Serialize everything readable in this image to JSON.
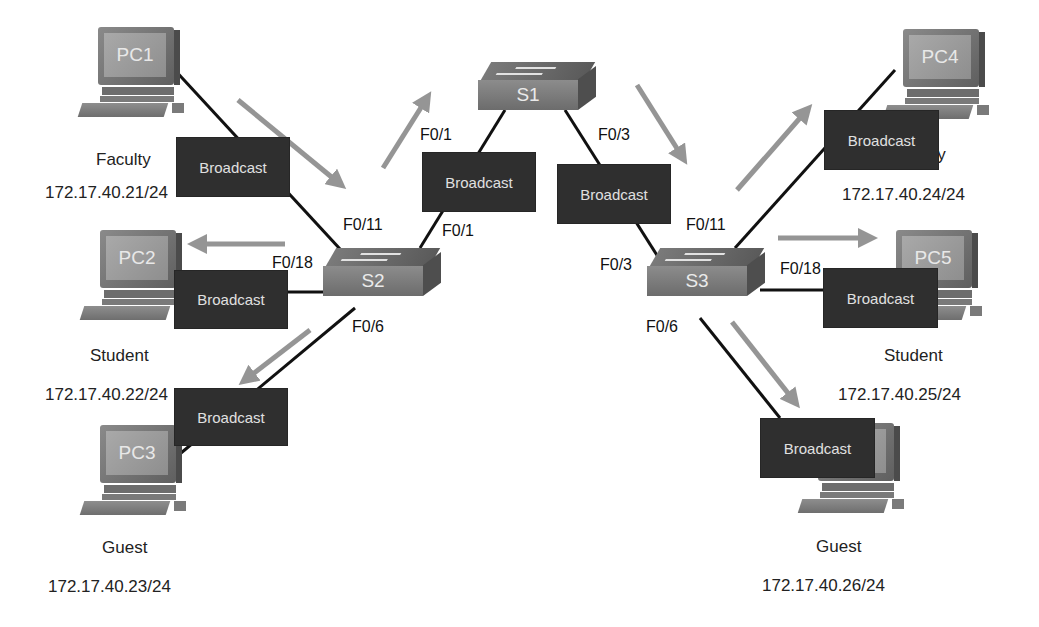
{
  "diagram": {
    "title_clipped": "",
    "switches": [
      {
        "id": "S1",
        "label": "S1"
      },
      {
        "id": "S2",
        "label": "S2"
      },
      {
        "id": "S3",
        "label": "S3"
      }
    ],
    "pcs": [
      {
        "id": "PC1",
        "label": "PC1",
        "role": "Faculty",
        "ip": "172.17.40.21/24"
      },
      {
        "id": "PC2",
        "label": "PC2",
        "role": "Student",
        "ip": "172.17.40.22/24"
      },
      {
        "id": "PC3",
        "label": "PC3",
        "role": "Guest",
        "ip": "172.17.40.23/24"
      },
      {
        "id": "PC4",
        "label": "PC4",
        "role": "Faculty",
        "ip": "172.17.40.24/24"
      },
      {
        "id": "PC5",
        "label": "PC5",
        "role": "Student",
        "ip": "172.17.40.25/24"
      },
      {
        "id": "PC6",
        "label": "",
        "role": "Guest",
        "ip": "172.17.40.26/24"
      }
    ],
    "ports": {
      "s2_f011": "F0/11",
      "s2_f018": "F0/18",
      "s2_f06": "F0/6",
      "s2_f01": "F0/1",
      "s1_f01": "F0/1",
      "s1_f03": "F0/3",
      "s3_f03": "F0/3",
      "s3_f011": "F0/11",
      "s3_f018": "F0/18",
      "s3_f06": "F0/6"
    },
    "broadcast_label": "Broadcast",
    "broadcasts": [
      {
        "id": "pc1-s2",
        "label": "Broadcast"
      },
      {
        "id": "s2-pc2",
        "label": "Broadcast"
      },
      {
        "id": "s2-pc3",
        "label": "Broadcast"
      },
      {
        "id": "s2-s1",
        "label": "Broadcast"
      },
      {
        "id": "s1-s3",
        "label": "Broadcast"
      },
      {
        "id": "s3-pc4",
        "label": "Broadcast"
      },
      {
        "id": "s3-pc5",
        "label": "Broadcast"
      },
      {
        "id": "s3-pc6",
        "label": "Broadcast"
      }
    ],
    "colors": {
      "link": "#111111",
      "arrow": "#8a8a8a",
      "broadcast_bg": "#2f2f2f",
      "broadcast_text": "#e0e0e0"
    }
  }
}
